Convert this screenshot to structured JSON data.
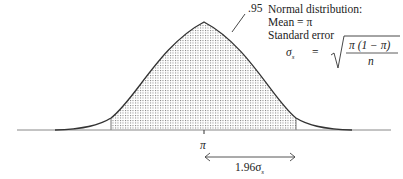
{
  "diagram": {
    "type": "normal-distribution-confidence-interval",
    "shaded_area_label": ".95",
    "mean_label": "π",
    "interval_label": "1.96σ",
    "interval_subscript": "s",
    "annotation": {
      "line1": "Normal distribution:",
      "line2": "Mean = π",
      "line3": "Standard error",
      "formula_lhs": "σ",
      "formula_lhs_sub": "s",
      "formula_eq": "=",
      "formula_numerator": "π (1 − π)",
      "formula_denominator": "n"
    },
    "colors": {
      "curve": "#333333",
      "shade": "#888888",
      "baseline": "#888888"
    }
  }
}
